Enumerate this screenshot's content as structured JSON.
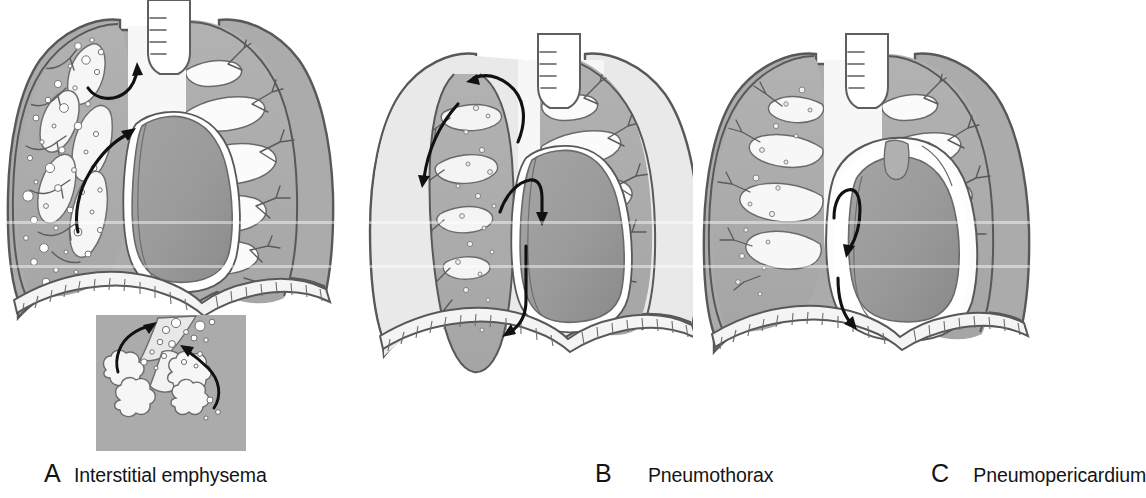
{
  "figure": {
    "background_color": "#ffffff",
    "panel_count": 3
  },
  "palette": {
    "lung_parenchyma": "#ababab",
    "lung_parenchyma_dark": "#9d9d9d",
    "heart_muscle": "#9a9a9a",
    "heart_muscle_dark": "#8c8c8c",
    "pleural_air": "#e9e9e9",
    "mediastinal_air": "#f5f5f5",
    "interstitial_air_bubble": "#ffffff",
    "inset_background": "#ababab",
    "outline_stroke": "#545454",
    "arrow_stroke": "#111111",
    "diaphragm_band": "#f2f2f2",
    "caption_text": "#141414"
  },
  "panels": [
    {
      "id": "a",
      "letter": "A",
      "label": "Interstitial emphysema",
      "structures": [
        "chest-wall-outline",
        "left-lung-parenchyma",
        "right-lung-parenchyma",
        "trachea-with-cartilage-rings",
        "bronchovascular-tree-right",
        "perivascular-interstitial-air-left",
        "interstitial-air-bubbles",
        "heart-silhouette",
        "pericardium-outline",
        "diaphragm-striated-band"
      ],
      "arrows": [
        {
          "name": "arrow-apical-interstitial-air",
          "direction": "up-right",
          "meaning": "air tracking toward hilum"
        },
        {
          "name": "arrow-mediastinal-air-track",
          "direction": "up",
          "meaning": "air tracking along perivascular sheath to mediastinum"
        }
      ],
      "inset": {
        "name": "alveolar-rupture-inset",
        "background_color": "#ababab",
        "structures": [
          "alveolar-cluster-left",
          "alveolar-cluster-right",
          "terminal-bronchiole",
          "perivascular-sheath",
          "escaped-air-bubbles"
        ],
        "arrows": [
          {
            "name": "arrow-inset-left-leak",
            "direction": "up-right"
          },
          {
            "name": "arrow-inset-right-leak",
            "direction": "up-left"
          }
        ]
      }
    },
    {
      "id": "b",
      "letter": "B",
      "label": "Pneumothorax",
      "structures": [
        "chest-wall-outline",
        "pleural-air-space-left",
        "collapsed-left-lung",
        "right-lung-parenchyma",
        "trachea-with-cartilage-rings",
        "bronchovascular-tree-right",
        "heart-silhouette-shifted",
        "pericardium-outline",
        "diaphragm-striated-band"
      ],
      "arrows": [
        {
          "name": "arrow-pleural-air-apex",
          "direction": "counterclockwise-over-apex"
        },
        {
          "name": "arrow-pleural-air-lateral",
          "direction": "down-left"
        },
        {
          "name": "arrow-mediastinal-shift-upper",
          "direction": "down"
        },
        {
          "name": "arrow-mediastinal-shift-lower",
          "direction": "down-left"
        }
      ]
    },
    {
      "id": "c",
      "letter": "C",
      "label": "Pneumopericardium",
      "structures": [
        "chest-wall-outline",
        "left-lung-parenchyma",
        "right-lung-parenchyma",
        "trachea-with-cartilage-rings",
        "bronchovascular-tree-right",
        "pericardial-air-halo",
        "heart-silhouette",
        "pericardial-sac-outline",
        "great-vessels",
        "diaphragm-striated-band"
      ],
      "arrows": [
        {
          "name": "arrow-pericardial-air-hook",
          "direction": "hooked-down"
        },
        {
          "name": "arrow-pericardial-air-descending",
          "direction": "down"
        }
      ]
    }
  ]
}
